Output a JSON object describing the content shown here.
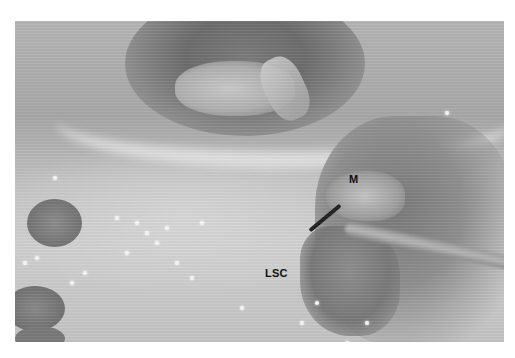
{
  "figure": {
    "type": "surgical-photograph",
    "colormode": "grayscale",
    "labels": [
      {
        "id": "m",
        "text": "M"
      },
      {
        "id": "lsc",
        "text": "LSC"
      }
    ]
  }
}
